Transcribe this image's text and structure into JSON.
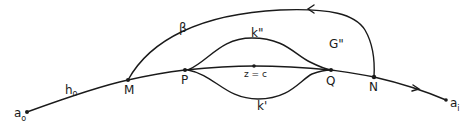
{
  "diagram": {
    "type": "contour-path-diagram",
    "points": {
      "a0": {
        "label": "a",
        "sub": "o"
      },
      "ai": {
        "label": "a",
        "sub": "i"
      },
      "M": {
        "label": "M"
      },
      "P": {
        "label": "P"
      },
      "Q": {
        "label": "Q"
      },
      "N": {
        "label": "N"
      },
      "zc": {
        "label": "z = c"
      }
    },
    "curves": {
      "h0": {
        "label": "h",
        "sub": "o"
      },
      "beta": {
        "label": "β"
      },
      "k_upper": {
        "label": "k\""
      },
      "k_lower": {
        "label": "k'"
      },
      "G": {
        "label": "G\""
      }
    }
  }
}
